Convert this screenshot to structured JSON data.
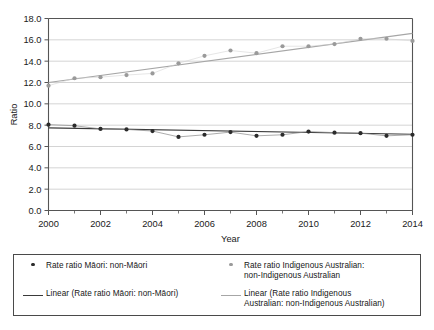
{
  "chart_data": {
    "type": "scatter",
    "title": "",
    "xlabel": "Year",
    "ylabel": "Ratio",
    "xlim": [
      2000,
      2014
    ],
    "ylim": [
      0.0,
      18.0
    ],
    "ytick_step": 2.0,
    "xtick_step": 2,
    "grid": "horizontal",
    "legend_position": "bottom",
    "x": [
      2000,
      2001,
      2002,
      2003,
      2004,
      2005,
      2006,
      2007,
      2008,
      2009,
      2010,
      2011,
      2012,
      2013,
      2014
    ],
    "ytick_labels": [
      "0.0",
      "2.0",
      "4.0",
      "6.0",
      "8.0",
      "10.0",
      "12.0",
      "14.0",
      "16.0",
      "18.0"
    ],
    "ytick_values": [
      0.0,
      2.0,
      4.0,
      6.0,
      8.0,
      10.0,
      12.0,
      14.0,
      16.0,
      18.0
    ],
    "xtick_labels": [
      "2000",
      "2002",
      "2004",
      "2006",
      "2008",
      "2010",
      "2012",
      "2014"
    ],
    "xtick_values": [
      2000,
      2002,
      2004,
      2006,
      2008,
      2010,
      2012,
      2014
    ],
    "xminor_values": [
      2001,
      2003,
      2005,
      2007,
      2009,
      2011,
      2013
    ],
    "series": [
      {
        "name": "Rate ratio Māori: non-Māori",
        "kind": "markers",
        "color": "#2b2b2b",
        "values": [
          8.05,
          7.95,
          7.65,
          7.6,
          7.45,
          6.9,
          7.1,
          7.35,
          7.0,
          7.1,
          7.4,
          7.3,
          7.25,
          7.0,
          7.1
        ]
      },
      {
        "name": "Rate ratio Indigenous Australian: non-Indigenous Australian",
        "kind": "markers",
        "color": "#9a9a9a",
        "values": [
          11.7,
          12.4,
          12.5,
          12.7,
          12.85,
          13.8,
          14.5,
          15.0,
          14.75,
          15.4,
          15.4,
          15.6,
          16.1,
          16.1,
          15.9
        ]
      },
      {
        "name": "Linear (Rate ratio Māori: non-Māori)",
        "kind": "trendline",
        "color": "#3a3a3a",
        "endpoints": [
          7.75,
          7.15
        ]
      },
      {
        "name": "Linear (Rate ratio Indigenous Australian: non-Indigenous Australian)",
        "kind": "trendline",
        "color": "#a6a6a6",
        "endpoints": [
          12.0,
          16.6
        ]
      }
    ]
  },
  "axes": {
    "y_title": "Ratio",
    "x_title": "Year",
    "y_labels": {
      "t0": "0.0",
      "t1": "2.0",
      "t2": "4.0",
      "t3": "6.0",
      "t4": "8.0",
      "t5": "10.0",
      "t6": "12.0",
      "t7": "14.0",
      "t8": "16.0",
      "t9": "18.0"
    },
    "x_labels": {
      "t0": "2000",
      "t1": "2002",
      "t2": "2004",
      "t3": "2006",
      "t4": "2008",
      "t5": "2010",
      "t6": "2012",
      "t7": "2014"
    }
  },
  "legend": {
    "entries": [
      {
        "marker": "dot-marker-dark",
        "label": "Rate ratio Māori: non-Māori"
      },
      {
        "marker": "dot-marker-grey",
        "label": "Rate ratio Indigenous Australian:\nnon-Indigenous Australian"
      },
      {
        "marker": "line-marker-dark",
        "label": "Linear (Rate ratio Māori: non-Māori)"
      },
      {
        "marker": "line-marker-grey",
        "label": "Linear (Rate ratio Indigenous\nAustralian: non-Indigenous Australian)"
      }
    ]
  },
  "colors": {
    "maori_marker": "#2b2b2b",
    "maori_trend": "#3a3a3a",
    "indigenous_marker": "#9a9a9a",
    "indigenous_trend": "#a6a6a6",
    "gridline": "#c9c9c9",
    "axis": "#555555",
    "legend_border": "#4a4a4a"
  }
}
